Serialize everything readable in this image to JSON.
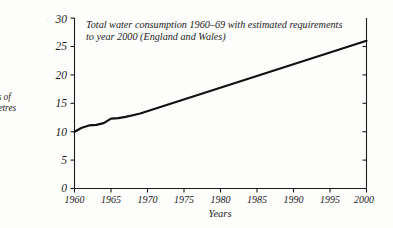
{
  "chart_data": {
    "type": "line",
    "title_lines": [
      "Total water consumption 1960–69 with estimated requirements",
      "to year 2000 (England and Wales)"
    ],
    "xlabel": "Years",
    "ylabel": "Millions of cubic metres per day",
    "ylabel_lines": [
      "illions of",
      "bic metres",
      "r day"
    ],
    "ylabel_clipped": true,
    "xlim": [
      1960,
      2000
    ],
    "ylim": [
      0,
      30
    ],
    "grid": false,
    "legend": null,
    "xticks": [
      "1960",
      "1965",
      "1970",
      "1975",
      "1980",
      "1985",
      "1990",
      "1995",
      "2000"
    ],
    "xtick_values": [
      1960,
      1965,
      1970,
      1975,
      1980,
      1985,
      1990,
      1995,
      2000
    ],
    "yticks": [
      "0",
      "5",
      "10",
      "15",
      "20",
      "25",
      "30"
    ],
    "ytick_values": [
      0,
      5,
      10,
      15,
      20,
      25,
      30
    ],
    "series": [
      {
        "name": "Total water consumption",
        "color": "#111111",
        "x": [
          1960,
          1961,
          1962,
          1963,
          1964,
          1965,
          1966,
          1967,
          1968,
          1969,
          2000
        ],
        "values": [
          10.0,
          10.7,
          11.1,
          11.2,
          11.5,
          12.3,
          12.4,
          12.6,
          12.9,
          13.2,
          26.0
        ]
      }
    ],
    "annotations": [
      "Solid segment 1960–69 shows recorded consumption; the straight run to 2000 is the estimated requirement."
    ]
  },
  "figure": {
    "axis_color": "#1b1b1b",
    "paper_color": "#fdfdfb"
  }
}
